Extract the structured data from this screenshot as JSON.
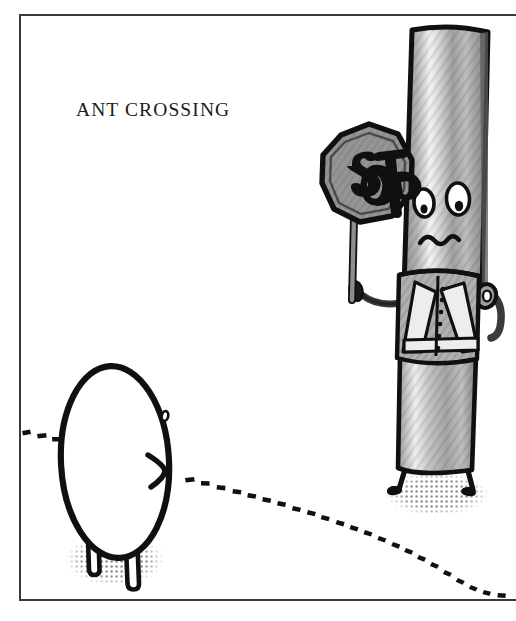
{
  "artwork": {
    "title_caption": "ANT CROSSING",
    "scene_description": "Cartoon stick-figure crossing guard holding a STOP sign while a large egg-shaped ant waits at a dotted ant trail",
    "canvas": {
      "width": 516,
      "height": 621,
      "background_color": "#ffffff"
    },
    "frame": {
      "label": "panel-border",
      "left": 19,
      "top": 14,
      "right": 516,
      "bottom": 601,
      "stroke_color": "#2b2b2b",
      "stroke_width": 2
    },
    "caption": {
      "text": "ANT CROSSING",
      "x": 76,
      "y": 116,
      "color": "#1a1a1a",
      "font_size_px": 19.5
    },
    "palette": {
      "ink": "#101010",
      "outline": "#171717",
      "mid_gray": "#8d8d8d",
      "light_gray": "#c9c9c9",
      "pale_gray": "#e2e2e2",
      "highlight": "#f2f2f2",
      "dark_gray": "#6a6a6a",
      "shadow_dot": "#9a9a9a",
      "paper": "#ffffff"
    },
    "elements": [
      {
        "name": "crossing-guard-body",
        "kind": "tall-striped-column",
        "fill": "#b4b4b4",
        "note": "vertical hatched cylinder torso with highlight band"
      },
      {
        "name": "guard-face",
        "kind": "face",
        "expression": "worried frown",
        "eyes": 2,
        "eye_fill": "#ffffff",
        "pupil_fill": "#101010"
      },
      {
        "name": "stop-sign",
        "kind": "octagon",
        "sign_text": "STOP",
        "fill": "#8d8d8d",
        "text_color": "#101010",
        "pole_fill": "#8d8d8d"
      },
      {
        "name": "safety-vest",
        "kind": "reflective-vest",
        "fill": "#a8a8a8",
        "stripe_fill": "#ededed",
        "buttons": 6
      },
      {
        "name": "guard-legs",
        "kind": "thin-legs-with-feet",
        "count": 2,
        "stroke": "#101010"
      },
      {
        "name": "ant-body",
        "kind": "egg-shape",
        "fill": "#ffffff",
        "stroke": "#101010",
        "legs": 2
      },
      {
        "name": "ant-eye",
        "kind": "small-oval",
        "stroke": "#101010"
      },
      {
        "name": "ant-mandible",
        "kind": "chevron",
        "stroke": "#101010"
      },
      {
        "name": "ant-trail",
        "kind": "dotted-path",
        "dot_count": 34,
        "color": "#101010",
        "direction": "left-edge to lower-right"
      },
      {
        "name": "ground-shadows",
        "kind": "halftone-dot-ellipse",
        "count": 2,
        "color": "#9a9a9a"
      }
    ]
  }
}
